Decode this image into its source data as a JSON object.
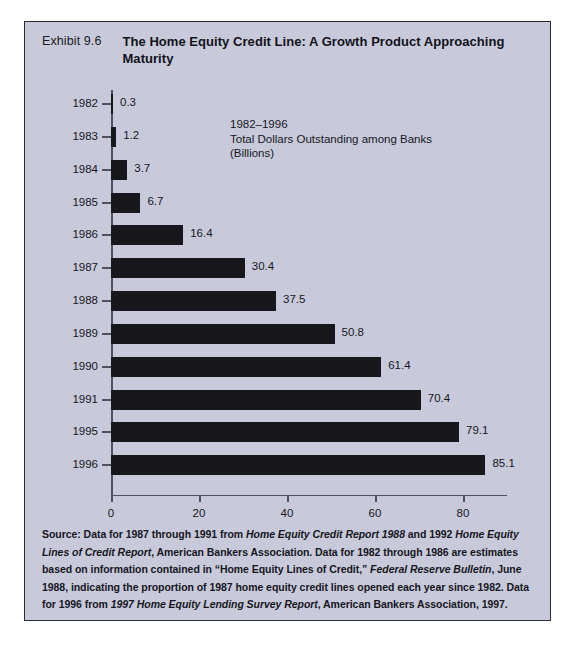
{
  "exhibit": {
    "number": "Exhibit 9.6",
    "title": "The Home Equity Credit Line: A Growth Product Approaching Maturity"
  },
  "annotation": {
    "line1": "1982–1996",
    "line2": "Total Dollars Outstanding among Banks",
    "line3": "(Billions)"
  },
  "source_note": {
    "full_text": "Source: Data for 1987 through 1991 from Home Equity Credit Report 1988 and 1992 Home Equity Lines of Credit Report, American Bankers Association. Data for 1982 through 1986 are estimates based on information contained in “Home Equity Lines of Credit,” Federal Reserve Bulletin, June 1988, indicating the proportion of 1987 home equity credit lines opened each year since 1982. Data for 1996 from 1997 Home Equity Lending Survey Report, American Bankers Association, 1997.",
    "segments": [
      {
        "text": "Source: Data for 1987 through 1991 from ",
        "italic": false
      },
      {
        "text": "Home Equity Credit Report 1988",
        "italic": true
      },
      {
        "text": " and 1992 ",
        "italic": false
      },
      {
        "text": "Home Equity Lines of Credit Report",
        "italic": true
      },
      {
        "text": ", American Bankers Association. Data for 1982 through 1986 are estimates based on information contained in “Home Equity Lines of Credit,” ",
        "italic": false
      },
      {
        "text": "Federal Reserve Bulletin",
        "italic": true
      },
      {
        "text": ", June 1988, indicating the proportion of 1987 home equity credit lines opened each year since 1982. Data for 1996 from ",
        "italic": false
      },
      {
        "text": "1997 Home Equity Lending Survey Report",
        "italic": true
      },
      {
        "text": ", American Bankers Association, 1997.",
        "italic": false
      }
    ]
  },
  "colors": {
    "panel_background": "#c8cadc",
    "panel_border": "#2a2a33",
    "bar_fill": "#17171c",
    "axis": "#52525e",
    "text": "#16161c"
  },
  "chart_data": {
    "type": "bar",
    "orientation": "horizontal",
    "title": "The Home Equity Credit Line: A Growth Product Approaching Maturity",
    "subtitle": "1982–1996 Total Dollars Outstanding among Banks (Billions)",
    "xlabel": "",
    "ylabel": "",
    "xlim": [
      0,
      90
    ],
    "xticks": [
      0,
      20,
      40,
      60,
      80
    ],
    "grid": false,
    "legend": false,
    "categories": [
      "1982",
      "1983",
      "1984",
      "1985",
      "1986",
      "1987",
      "1988",
      "1989",
      "1990",
      "1991",
      "1995",
      "1996"
    ],
    "values": [
      0.3,
      1.2,
      3.7,
      6.7,
      16.4,
      30.4,
      37.5,
      50.8,
      61.4,
      70.4,
      79.1,
      85.1
    ],
    "value_labels": [
      "0.3",
      "1.2",
      "3.7",
      "6.7",
      "16.4",
      "30.4",
      "37.5",
      "50.8",
      "61.4",
      "70.4",
      "79.1",
      "85.1"
    ]
  }
}
